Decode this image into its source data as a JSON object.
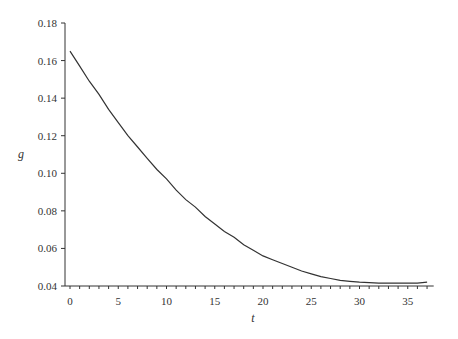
{
  "chart_data": {
    "type": "line",
    "title": "",
    "xlabel": "t",
    "ylabel": "g",
    "xlim": [
      -0.5,
      38
    ],
    "ylim": [
      0.04,
      0.18
    ],
    "grid": false,
    "legend": null,
    "x_ticks": [
      0,
      5,
      10,
      15,
      20,
      25,
      30,
      35
    ],
    "x_tick_labels": [
      "0",
      "5",
      "10",
      "15",
      "20",
      "25",
      "30",
      "35"
    ],
    "x_minor_tick_step": 1,
    "y_ticks": [
      0.04,
      0.06,
      0.08,
      0.1,
      0.12,
      0.14,
      0.16,
      0.18
    ],
    "y_tick_labels": [
      "0.04",
      "0.06",
      "0.08",
      "0.10",
      "0.12",
      "0.14",
      "0.16",
      "0.18"
    ],
    "series": [
      {
        "name": "g",
        "color": "#333333",
        "x": [
          0,
          1,
          2,
          3,
          4,
          5,
          6,
          7,
          8,
          9,
          10,
          11,
          12,
          13,
          14,
          15,
          16,
          17,
          18,
          19,
          20,
          21,
          22,
          23,
          24,
          25,
          26,
          27,
          28,
          29,
          30,
          31,
          32,
          33,
          34,
          35,
          36,
          37
        ],
        "values": [
          0.165,
          0.157,
          0.149,
          0.142,
          0.134,
          0.127,
          0.12,
          0.114,
          0.108,
          0.102,
          0.097,
          0.091,
          0.086,
          0.082,
          0.077,
          0.073,
          0.069,
          0.066,
          0.062,
          0.059,
          0.056,
          0.054,
          0.052,
          0.05,
          0.048,
          0.0465,
          0.045,
          0.044,
          0.043,
          0.0425,
          0.042,
          0.0418,
          0.0415,
          0.0415,
          0.0415,
          0.0415,
          0.0415,
          0.042
        ]
      }
    ]
  }
}
